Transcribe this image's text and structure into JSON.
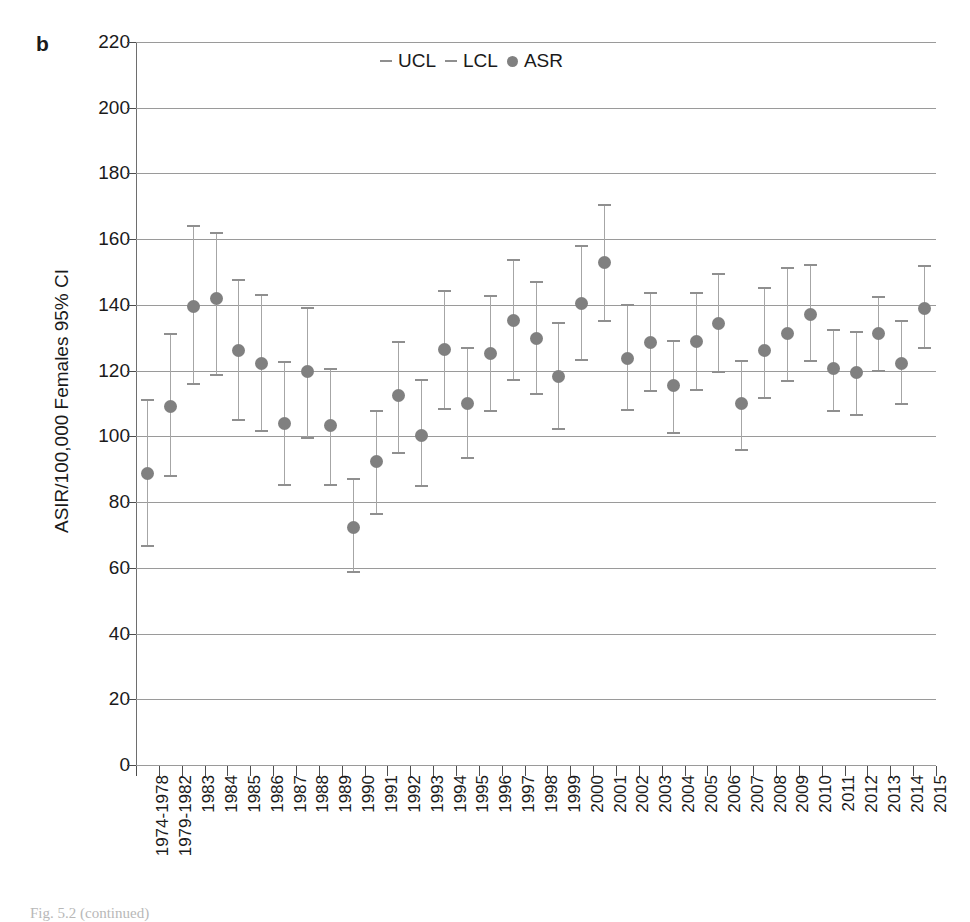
{
  "figure": {
    "panel_letter": "b",
    "caption": "Fig. 5.2 (continued)"
  },
  "legend": {
    "position": "top-center",
    "entries": [
      {
        "marker": "dash",
        "label": "UCL"
      },
      {
        "marker": "dash",
        "label": "LCL"
      },
      {
        "marker": "dot",
        "label": "ASR"
      }
    ]
  },
  "colors": {
    "marker": "#808080",
    "errorbar": "#a6a6a6",
    "gridline": "#9a9a9a",
    "axis": "#6e6e6e",
    "text": "#1a1a1a"
  },
  "chart_data": {
    "type": "scatter",
    "title": "",
    "subtitle": "",
    "xlabel": "",
    "ylabel": "ASIR/100,000 Females 95% CI",
    "ylim": [
      0,
      220
    ],
    "ytick_step": 20,
    "yticks": [
      0,
      20,
      40,
      60,
      80,
      100,
      120,
      140,
      160,
      180,
      200,
      220
    ],
    "grid": true,
    "legend_entries": [
      "UCL",
      "LCL",
      "ASR"
    ],
    "categories": [
      "1974-1978",
      "1979-1982",
      "1983",
      "1984",
      "1985",
      "1986",
      "1987",
      "1988",
      "1989",
      "1990",
      "1991",
      "1992",
      "1993",
      "1994",
      "1995",
      "1996",
      "1997",
      "1998",
      "1999",
      "2000",
      "2001",
      "2002",
      "2003",
      "2004",
      "2005",
      "2006",
      "2007",
      "2008",
      "2009",
      "2010",
      "2011",
      "2012",
      "2013",
      "2014",
      "2015"
    ],
    "series": [
      {
        "name": "ASR",
        "values": [
          88.8,
          109.2,
          139.5,
          141.8,
          126.2,
          122.3,
          104.0,
          119.7,
          103.2,
          72.3,
          92.2,
          112.3,
          100.3,
          126.5,
          110.0,
          125.1,
          135.4,
          129.7,
          118.2,
          140.5,
          152.8,
          123.6,
          128.7,
          115.4,
          128.8,
          134.2,
          109.9,
          126.1,
          131.3,
          137.2,
          120.5,
          119.3,
          131.2,
          122.3,
          139.0
        ]
      },
      {
        "name": "UCL",
        "values": [
          111.2,
          131.0,
          164.0,
          161.8,
          147.5,
          143.0,
          122.7,
          139.0,
          120.5,
          87.0,
          107.8,
          128.8,
          117.2,
          144.2,
          126.8,
          142.7,
          153.8,
          147.0,
          134.5,
          157.8,
          170.5,
          140.0,
          143.5,
          129.0,
          143.5,
          149.5,
          123.0,
          145.2,
          151.3,
          152.0,
          132.5,
          131.8,
          142.5,
          135.2,
          151.8
        ]
      },
      {
        "name": "LCL",
        "values": [
          66.5,
          87.8,
          115.8,
          118.8,
          105.0,
          101.5,
          85.3,
          99.5,
          85.3,
          58.8,
          76.3,
          94.8,
          85.0,
          108.2,
          93.5,
          107.8,
          117.3,
          112.8,
          102.2,
          123.2,
          135.0,
          108.0,
          113.8,
          101.0,
          114.2,
          119.5,
          95.8,
          111.8,
          116.8,
          122.8,
          107.8,
          106.5,
          120.0,
          109.8,
          126.8
        ]
      }
    ]
  }
}
